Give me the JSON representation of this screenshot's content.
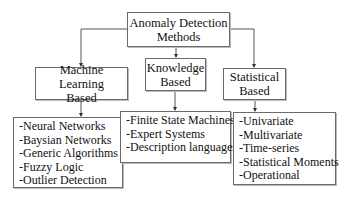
{
  "root": {
    "line1": "Anomaly Detection",
    "line2": "Methods"
  },
  "categories": [
    {
      "id": "machine-learning",
      "line1": "Machine Learning",
      "line2": "Based",
      "items": [
        "-Neural Networks",
        "-Baysian Networks",
        "-Generic Algorithms",
        "-Fuzzy Logic",
        "-Outlier Detection"
      ]
    },
    {
      "id": "knowledge",
      "line1": "Knowledge",
      "line2": "Based",
      "items": [
        "-Finite State Machines",
        "-Expert Systems",
        "-Description languages"
      ]
    },
    {
      "id": "statistical",
      "line1": "Statistical",
      "line2": "Based",
      "items": [
        "-Univariate",
        "-Multivariate",
        "-Time-series",
        "-Statistical Moments",
        "-Operational"
      ]
    }
  ],
  "colors": {
    "border": "#6a6a6a",
    "line": "#555555",
    "background": "#ffffff"
  }
}
